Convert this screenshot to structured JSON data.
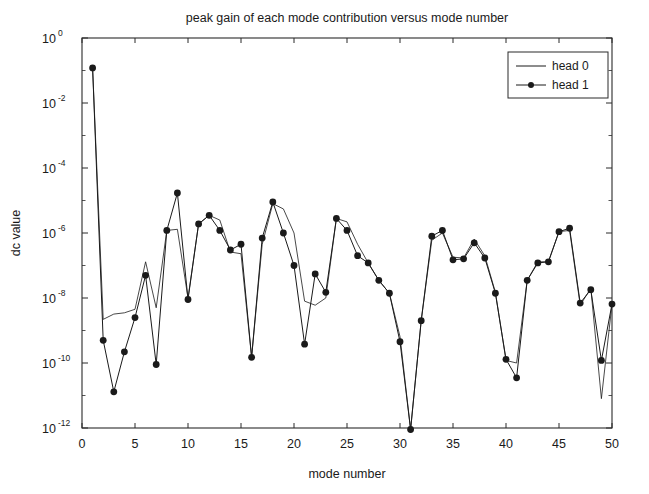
{
  "chart_data": {
    "type": "line",
    "title": "peak gain of each mode contribution versus mode number",
    "xlabel": "mode number",
    "ylabel": "dc value",
    "yscale": "log",
    "xlim": [
      0,
      50
    ],
    "ylim": [
      1e-12,
      1
    ],
    "xticks": [
      0,
      5,
      10,
      15,
      20,
      25,
      30,
      35,
      40,
      45,
      50
    ],
    "xticklabels": [
      "0",
      "5",
      "10",
      "15",
      "20",
      "25",
      "30",
      "35",
      "40",
      "45",
      "50"
    ],
    "yticks": [
      1,
      0.01,
      0.0001,
      1e-06,
      1e-08,
      1e-10,
      1e-12
    ],
    "yticklabels": [
      "10^0",
      "10^-2",
      "10^-4",
      "10^-6",
      "10^-8",
      "10^-10",
      "10^-12"
    ],
    "ytick_mantissa": [
      "10",
      "10",
      "10",
      "10",
      "10",
      "10",
      "10"
    ],
    "ytick_exponents": [
      "0",
      "-2",
      "-4",
      "-6",
      "-8",
      "-10",
      "-12"
    ],
    "grid": false,
    "legend_position": "top-right",
    "x": [
      1,
      2,
      3,
      4,
      5,
      6,
      7,
      8,
      9,
      10,
      11,
      12,
      13,
      14,
      15,
      16,
      17,
      18,
      19,
      20,
      21,
      22,
      23,
      24,
      25,
      26,
      27,
      28,
      29,
      30,
      31,
      32,
      33,
      34,
      35,
      36,
      37,
      38,
      39,
      40,
      41,
      42,
      43,
      44,
      45,
      46,
      47,
      48,
      49,
      50
    ],
    "series": [
      {
        "name": "head 0",
        "marker": "none",
        "color": "#1a1a1a",
        "values": [
          0.12,
          2.2e-09,
          3.2e-09,
          3.5e-09,
          4.5e-09,
          1.3e-07,
          5e-09,
          1.2e-06,
          1.3e-06,
          1e-08,
          1.9e-06,
          3.5e-06,
          2.5e-06,
          2.6e-07,
          2.3e-07,
          1.5e-10,
          4.5e-07,
          8e-06,
          5.5e-06,
          1e-06,
          8e-09,
          6e-09,
          1e-08,
          2.8e-06,
          2.2e-06,
          4.5e-07,
          1.2e-07,
          3.5e-08,
          1.4e-08,
          6.5e-10,
          9e-13,
          2e-09,
          6e-07,
          1e-06,
          1.8e-07,
          1.7e-07,
          6.5e-07,
          2e-07,
          1.5e-08,
          1.2e-10,
          1e-10,
          3.5e-08,
          1.3e-07,
          1.3e-07,
          1.1e-06,
          1.2e-06,
          6e-09,
          2e-08,
          8e-12,
          6.5e-09
        ]
      },
      {
        "name": "head 1",
        "marker": "filled-circle",
        "color": "#1a1a1a",
        "values": [
          0.12,
          5e-10,
          1.3e-11,
          2.2e-10,
          2.5e-09,
          5e-08,
          9e-11,
          1.2e-06,
          1.7e-05,
          9e-09,
          1.9e-06,
          3.5e-06,
          1.2e-06,
          3e-07,
          4.5e-07,
          1.5e-10,
          7e-07,
          9e-06,
          1e-06,
          1e-07,
          3.8e-10,
          5.5e-08,
          1.5e-08,
          2.8e-06,
          1.2e-06,
          2e-07,
          1.2e-07,
          3.5e-08,
          1.4e-08,
          4.5e-10,
          9e-13,
          2e-09,
          8e-07,
          1.2e-06,
          1.5e-07,
          1.6e-07,
          5e-07,
          1.7e-07,
          1.4e-08,
          1.3e-10,
          3.5e-11,
          3.5e-08,
          1.2e-07,
          1.3e-07,
          1.1e-06,
          1.4e-06,
          7e-09,
          1.8e-08,
          1.2e-10,
          6.5e-09
        ]
      }
    ]
  },
  "legend": {
    "entries": [
      {
        "label": "head 0",
        "marker": "line"
      },
      {
        "label": "head 1",
        "marker": "line-with-dot"
      }
    ]
  }
}
